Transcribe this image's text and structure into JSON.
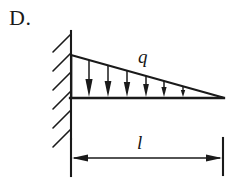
{
  "figure": {
    "choice_label": "D.",
    "load_symbol": "q",
    "length_symbol": "l",
    "ink_color": "#1a1a1a",
    "background_color": "#ffffff"
  },
  "geometry": {
    "wall_x": 71,
    "wall_top_y": 31,
    "wall_bottom_y": 139,
    "beam_y": 98,
    "beam_right_x": 223,
    "load_peak_y": 55,
    "hatch_count": 6,
    "arrow_count": 6,
    "arrow_x_positions": [
      89,
      108,
      127,
      146,
      164,
      183
    ],
    "dimension_line_y": 158,
    "dimension_tick_left_x": 71,
    "dimension_tick_right_x": 223,
    "dimension_tick_top_y": 139,
    "dimension_tick_bottom_y": 176
  }
}
